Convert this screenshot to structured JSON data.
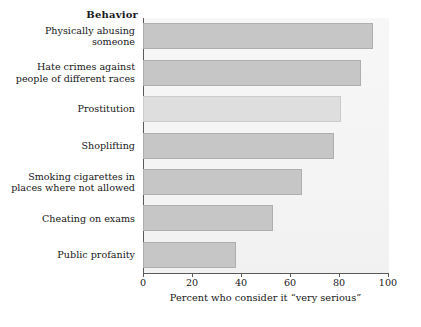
{
  "chart_data": {
    "type": "bar",
    "orientation": "horizontal",
    "title": "",
    "group_title": "Behavior",
    "xlabel": "Percent who consider it “very serious”",
    "ylabel": "Behavior",
    "xlim": [
      0,
      100
    ],
    "xticks": [
      0,
      20,
      40,
      60,
      80,
      100
    ],
    "xtick_labels": [
      "0",
      "20",
      "40",
      "60",
      "80",
      "100"
    ],
    "grid": false,
    "legend": "none",
    "categories": [
      "Physically abusing someone",
      "Hate crimes against people of different races",
      "Prostitution",
      "Shoplifting",
      "Smoking cigarettes in places where not allowed",
      "Cheating on exams",
      "Public profanity"
    ],
    "category_lines": [
      [
        "Physically abusing",
        "someone"
      ],
      [
        "Hate crimes against",
        "people of different races"
      ],
      [
        "Prostitution"
      ],
      [
        "Shoplifting"
      ],
      [
        "Smoking cigarettes in",
        "places where not allowed"
      ],
      [
        "Cheating on exams"
      ],
      [
        "Public profanity"
      ]
    ],
    "values": [
      94,
      89,
      81,
      78,
      65,
      53,
      38
    ],
    "bar_colors": [
      "#c6c6c6",
      "#c6c6c6",
      "#dedede",
      "#c6c6c6",
      "#c6c6c6",
      "#c6c6c6",
      "#c6c6c6"
    ]
  },
  "colors": {
    "bar_fill": "#c6c6c6",
    "bar_fill_light": "#dedede",
    "bar_border": "#aeaeae",
    "axis_line": "#5a5a5a",
    "plot_background": "#f4f4f4",
    "text": "#171717",
    "page_background": "#ffffff"
  }
}
